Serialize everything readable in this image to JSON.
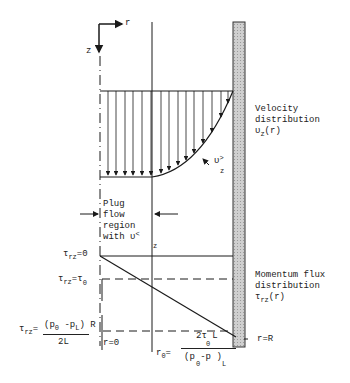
{
  "diagram": {
    "axes": {
      "r_label": "r",
      "z_label": "z"
    },
    "velocity_label": {
      "line1": "Velocity",
      "line2": "distribution",
      "symbol": "υ",
      "sub": "z",
      "arg": "(r)"
    },
    "momentum_label": {
      "line1": "Momentum flux",
      "line2": "distribution",
      "symbol": "τ",
      "sub": "rz",
      "arg": "(r)"
    },
    "plug_label": {
      "line1": "Plug",
      "line2": "flow",
      "line3": "region",
      "line4": "with υ",
      "line4_sym": "<",
      "line4_sub": "z"
    },
    "u_greater": {
      "symbol": "υ",
      "sup": ">",
      "sub": "z"
    },
    "tau_zero": {
      "symbol": "τ",
      "sub": "rz",
      "eq": "=0"
    },
    "tau_tau0": {
      "symbol": "τ",
      "sub": "rz",
      "eq": "=τ",
      "eq_sub": "0"
    },
    "tau_wall": {
      "symbol": "τ",
      "sub": "rz",
      "eq": "=",
      "numerator": "(p",
      "num_sub0": "0",
      "num_mid": " -p",
      "num_subL": "L",
      "num_end": ") R",
      "denominator": "2L"
    },
    "r_zero": "r=0",
    "r_R": "r=R",
    "r0_formula": {
      "lhs": "r",
      "lhs_sub": "0",
      "eq": "=",
      "numerator": "2τ  L",
      "num_sub": "0",
      "denominator": "(p  -p )",
      "den_sub0": "0",
      "den_subL": "L"
    },
    "colors": {
      "line": "#1a1a1a",
      "wall_fill": "#c8c8c8",
      "wall_stroke": "#333333",
      "text": "#222222"
    }
  }
}
